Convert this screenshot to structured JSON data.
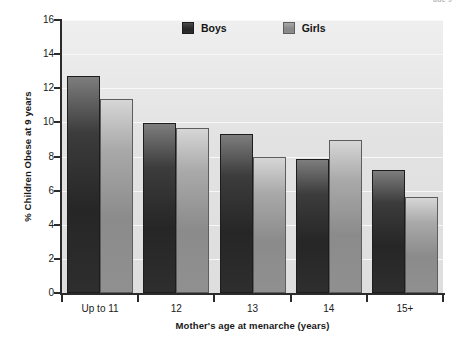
{
  "top_fragment": "age 9",
  "chart_data": {
    "type": "bar",
    "title": "",
    "xlabel": "Mother's age at menarche (years)",
    "ylabel": "% Children Obese at 9 years",
    "categories": [
      "Up to 11",
      "12",
      "13",
      "14",
      "15+"
    ],
    "series": [
      {
        "name": "Boys",
        "color": "#262626",
        "values": [
          12.7,
          9.95,
          9.3,
          7.85,
          7.2
        ]
      },
      {
        "name": "Girls",
        "color": "#8b8b8b",
        "values": [
          11.35,
          9.65,
          8.0,
          8.95,
          5.65
        ]
      }
    ],
    "ylim": [
      0,
      16
    ],
    "ytick_labels": [
      "0",
      "2",
      "4",
      "6",
      "8",
      "10",
      "12",
      "14",
      "16"
    ],
    "ytick_values": [
      0,
      2,
      4,
      6,
      8,
      10,
      12,
      14,
      16
    ],
    "grid": true,
    "grid_color": "#f8f8f8",
    "plot_background": "#e4e4e4",
    "legend_position": "top-center",
    "legend_entries": [
      "Boys",
      "Girls"
    ]
  }
}
